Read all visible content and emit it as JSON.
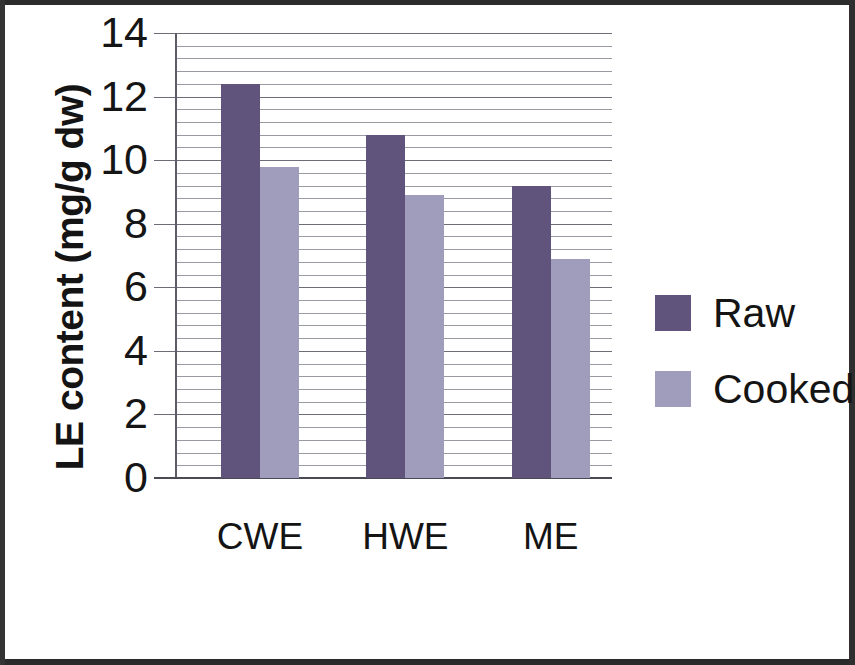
{
  "chart_data": {
    "type": "bar",
    "title": "",
    "subtitle": "",
    "xlabel": "EXTRACTS",
    "ylabel": "LE content (mg/g dw)",
    "categories": [
      "CWE",
      "HWE",
      "ME"
    ],
    "series": [
      {
        "name": "Raw",
        "color": "#60537c",
        "values": [
          12.4,
          10.8,
          9.2
        ]
      },
      {
        "name": "Cooked",
        "color": "#a09cbb",
        "values": [
          9.8,
          8.9,
          6.9
        ]
      }
    ],
    "ylim": [
      0,
      14
    ],
    "ytick_labels": [
      "14",
      "12",
      "10",
      "8",
      "6",
      "4",
      "2",
      "0"
    ],
    "ytick_values": [
      14,
      12,
      10,
      8,
      6,
      4,
      2,
      0
    ],
    "ytick_step": 2,
    "minor_gridline_step": 0.4,
    "grid": true,
    "legend_position": "right",
    "legend_entries": [
      "Raw",
      "Cooked"
    ]
  },
  "axes": {
    "y_title": "LE content (mg/g dw)",
    "x_title": "EXTRACTS"
  },
  "legend": {
    "raw_label": "Raw",
    "cooked_label": "Cooked"
  },
  "ticks": {
    "y0": "0",
    "y2": "2",
    "y4": "4",
    "y6": "6",
    "y8": "8",
    "y10": "10",
    "y12": "12",
    "y14": "14"
  },
  "categories": {
    "c0": "CWE",
    "c1": "HWE",
    "c2": "ME"
  },
  "colors": {
    "raw": "#60537c",
    "cooked": "#a09cbb",
    "gridline": "#9a9aa4",
    "axis": "#5d5d68",
    "text": "#141414"
  }
}
